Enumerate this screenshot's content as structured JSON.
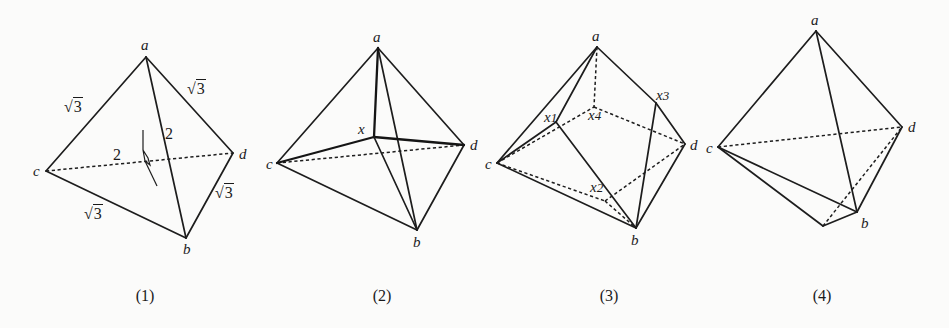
{
  "figures": [
    {
      "caption": "(1)",
      "vertices": {
        "a": "a",
        "b": "b",
        "c": "c",
        "d": "d"
      },
      "edge_labels": {
        "ac": "3",
        "ad": "3",
        "ab": "2",
        "cd": "2",
        "bd": "3",
        "bc": "3"
      },
      "edge_label_types": {
        "ac": "sqrt",
        "ad": "sqrt",
        "ab": "plain",
        "cd": "plain",
        "bd": "sqrt",
        "bc": "sqrt"
      },
      "edges_solid": [
        "a-c",
        "a-d",
        "a-b",
        "c-b",
        "b-d"
      ],
      "edges_dashed": [
        "c-d"
      ],
      "marks": [
        "dihedral-angle-mark"
      ]
    },
    {
      "caption": "(2)",
      "vertices": {
        "a": "a",
        "b": "b",
        "c": "c",
        "d": "d",
        "x": "x"
      },
      "edges_solid": [
        "a-c",
        "a-d",
        "a-b",
        "c-b",
        "b-d",
        "a-x",
        "x-b"
      ],
      "edges_thick": [
        "c-x",
        "x-d"
      ],
      "edges_dashed": [
        "c-d"
      ]
    },
    {
      "caption": "(3)",
      "vertices": {
        "a": "a",
        "b": "b",
        "c": "c",
        "d": "d",
        "x1": "x1",
        "x2": "x2",
        "x3": "x3",
        "x4": "x4"
      },
      "vertex_label_parts": {
        "x1": {
          "base": "x",
          "sub": "1"
        },
        "x2": {
          "base": "x",
          "sub": "2"
        },
        "x3": {
          "base": "x",
          "sub": "3"
        },
        "x4": {
          "base": "x",
          "sub": "4"
        }
      },
      "edges_solid": [
        "a-c",
        "a-x1",
        "x1-c",
        "x1-b",
        "a-x3",
        "x3-d",
        "x3-b",
        "c-b",
        "d-b"
      ],
      "edges_dashed": [
        "a-x4",
        "c-x4",
        "x4-d",
        "c-x2",
        "x2-b",
        "x2-d"
      ]
    },
    {
      "caption": "(4)",
      "vertices": {
        "a": "a",
        "b": "b",
        "c": "c",
        "d": "d"
      },
      "edges_solid": [
        "a-c",
        "a-d",
        "a-b",
        "c-b",
        "c-e",
        "e-b",
        "b-d"
      ],
      "edges_dashed": [
        "c-d",
        "e-d"
      ],
      "unlabeled_vertices": [
        "e"
      ]
    }
  ],
  "style": {
    "line_color": "#1d1d1d",
    "background": "#fbfbfa"
  }
}
